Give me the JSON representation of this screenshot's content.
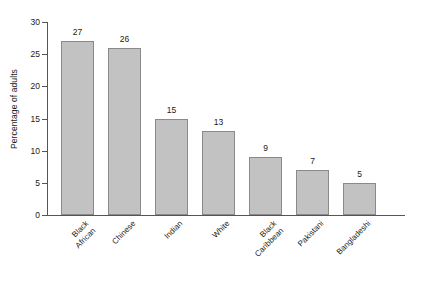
{
  "chart_data": {
    "type": "bar",
    "title": "",
    "subtitle": "",
    "xlabel": "",
    "ylabel": "Percentage of adults",
    "categories": [
      "Black\nAfrican",
      "Chinese",
      "Indian",
      "White",
      "Black\nCaribbean",
      "Pakistani",
      "Bangladeshi"
    ],
    "values": [
      27,
      26,
      15,
      13,
      9,
      7,
      5
    ],
    "value_labels": [
      "27",
      "26",
      "15",
      "13",
      "9",
      "7",
      "5"
    ],
    "ylim": [
      0,
      30
    ],
    "yticks": [
      0,
      5,
      10,
      15,
      20,
      25,
      30
    ],
    "ytick_labels": [
      "0",
      "5",
      "10",
      "15",
      "20",
      "25",
      "30"
    ],
    "grid": false,
    "legend": false,
    "legend_position": "none",
    "bar_color": "#c2c2c2",
    "bar_edge_color": "#8a8a8a",
    "axis_color": "#555555",
    "text_color": "#1a1a1a",
    "background": "#ffffff"
  }
}
